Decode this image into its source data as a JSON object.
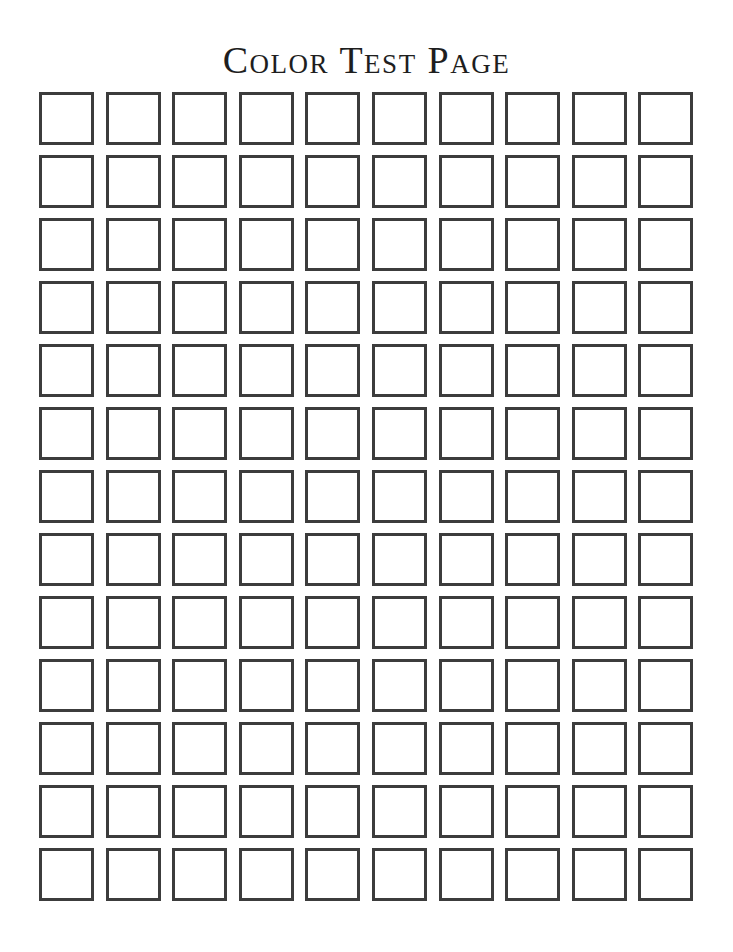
{
  "page": {
    "title": "Color Test Page"
  },
  "grid": {
    "rows": 13,
    "columns": 10,
    "border_color": "#3c3c3c",
    "fill_color": "#ffffff",
    "cells_filled": 0
  }
}
